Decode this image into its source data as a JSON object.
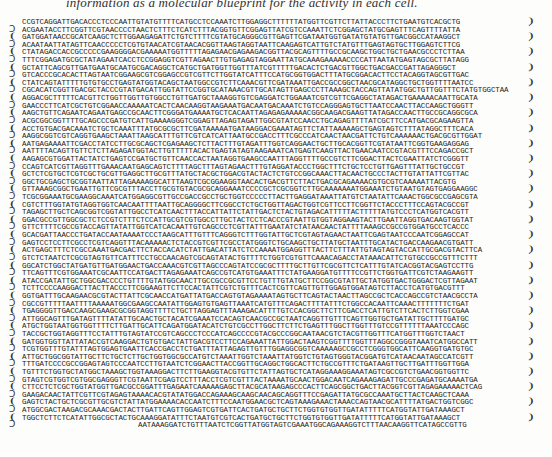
{
  "caption": "information as a molecular blueprint for the activity in each cell.",
  "sequence": {
    "lines": [
      "CCGTCAGGATTGACACCCTCCCAATTGTATGTTTTCATGCCTCCAAATCTTGGAGGCTTTTTTATGGTTCGTTCTTATTACCCTTCTGAATGTCACGCTG",
      "ACGAATACCTTCGGTTCGTAACCCCTAACTCTTTCTCATCTTTACGGTGTTCGGAGTTATCGTCCAAATTCTCGGAGCTATGCGAGTTTCAGTTTTATTA",
      "GATGGATAACCGCATCAAGCTCTTGGAAGAGATTCTGTCTTTTCGTATGCAGGGCGTTGAGTTCGATAATGGTGATATGTATGTTGACGGCCATAAGGCT",
      "ACAATAATTATAGTTCAACCCCCTCGTGTAACATCGTAACACGGTTAAGTAGGTAATTCAAGAGTCATTGTCTATGTTTGAGTAGTGCTTGGAGTCTTCG",
      "CTATAGACCACCGCCCCCGAAGGGGACGAAAAATGGTTTTTAGAGAACGAGAAGACGGTTACGCAGTTTTGCCGCAAGCTGGCTGCTGAACGCCCTCTTAA",
      "TTTCGGAGATGCGCTATAGAATCACCTCCGGAGGTCGTTAGAACTTGTGAGAGTAGGAATTATGCAAAGAAAAACCCCATTAATATGAGTAGCGCTTATAGG",
      "GCTATTCAGCGTTGATGAATGCAATGCGACAGGCTCATGCTGATGGTTGGTTTATCGTTTTTGACACTCTGACGTTGGCTGACGACCGATTAGAGGGCT",
      "GTCACCCGCACACTTAGTAATCGGAAGCGTCGGAGCCGTCGTTCTTGGTATCATTTCCATGCGGTGGACTTTATGCGGACACTTCCTACAGGTAGCGTTGAC",
      "CTATCAGTATTTTTGTGTGCCTGAGTATGGTACAGCTAATGGCCGTCTTCAAACGTTCGATAAATTGACCGCCGGCTAACGCATAGGCTGCTGGTTTTAATCC",
      "CGCACATCGGTTGACGCTACCCGTATGACATTGGTATTCCGGTGCATAAACGTTGCATAGTTGAGCCCTTAAAGCTACCAGTTATATGGCTGTTGGTTTCTATGTGGCTAA",
      "AGGACGCTTTTTCACGTTCTGGTTGGTTGTGGCCTGTTGATGCTAAAGGTGTCGAGGATCTGGAAATCGTCGTTCGAGGCTATAGACTGAAAAACAATTGCATA",
      "GAACCCTTCATCGCTGTCGGAACCAAAAATCACTCAACAAGGTAAGAAATGACAATGACAAATCTGTCCAGGGAGTGCTTAATCCAACTTACCAAGCTGGGTT",
      "AAGCTGTTCAGAATCAGAATGAGCCGCAACTTCGGGATGAAAATGCTCACAATTAGAGAGAAAAACGGCAAGACGAAGTTATAGACCAACTTGCCGCAGGCGCA",
      "ACGCGGCGGTTTTGCAGCCCGATGTCATTGAAAAGGGTCGGAGTTAGAGTAGATTGGCGTATCCAACCTGCAGAGTTTTATCGCTTCCATGACGCAGAAGTTA",
      "ACCTGTGACGACAAATCTGCTCAAATTTATGCGCGCTTCGATAAAAATGATAAGGACGAAATAGTTCTATTAAAAAGCTGAGTAGTCTTTATAGGCTTTCACA",
      "AAGGCGGTCGTCAGGTGAAGCTAAATTAAGCATTTGTTCGTCATCATTAATGCCGACCTTTCGCCCATCAACTAACGATTCTGTCAAAAAACTGACGCGTTGGAT",
      "AATGAGAAAATTCGACCTATCCTTGCGCAGCTCGAGAAGCTCTTACTTTGTAGATTTGGTCAGGAACTGCTTGCACGGTTCGTATAATTCGGTGAAGAGGAG",
      "AATTTTACAGTTGTTCTCTTAGAGATGGTACTTGTTTTTACACTGAGTATAGTAAGAAATCATGAGTCAAGTTACTGAACAATCCGTACGTTTCCAGACCGCT",
      "AAGAGCGTGGATTACTATCTGAGTCCGATGCTGTTCAACCACTAATAGGTGAAGCCAATTTAGGTTTTGCCGTCTTCGGACTTACTCGAATTATCTCGGGTT",
      "CCAGTCATCGTTAGGTTTGAAACAATGAGCAGTCTTTTAGCTTTAGTAGAACTTTGTAGGATACCCTGGCTTTCTGCTCCTGTTGAGTTTATTGCTGCCGT",
      "GCTCTCGTGCTCGTCGCTGCGTTGAGGCTTGCGTTTATGCTACGCTGGACGTACTACTCTGTCCGGCAAACTTACAACTGCCCTACTTGTATTATTCGTTAC",
      "GGCTGCGAGCTGCGGTAATTATTAGAAAAGGCATTTAAGTCGCGGAAGGTAACACTGACGTTCTTACTGACGCAGAAAACGTGCGTCAAAAATTACGTG",
      "GTTAAAGCGGCTGAATTGTTCGCGTTTACCTTGCGTGTACGCGCAGGAAATCCCCGCTCGCGGTCTTGCAAAAAAATGGAAATCTGTAATGTAGTGAGGAAGGC",
      "TCGCGGAAATGCGAAGGCAAATCATGGAGGCGTTGCCGACCGCCTGCTGGTCCCCCTTACTTGAGGATAAATTATGTCTAATATTCAAACTGGCGCCGAGCGTA",
      "CGTCTTTGGTATGTAGGTGGTCAACAATTTTAATTGCAGGGGCTTCGGCCTCTGCTGGTTAGACTGGTCGTTCCTTCGGTTCTACCCTTTCCAGTACGCCGT",
      "TAGAGCTTGCTCAGCGGTCGGTATTGGCCTCATCAACTTTACCATTATTCTATTGACTCTACTGTAGACATTTTTACTTTTTATGTCCCTCATGGTCACGTT",
      "GGACGCCGTTGGCGCTCTCCGTCTTTCTCCATTGCGTCGTGGCCTTGCTACTCCTCACCCGTAATTGTGGTAGGAAGTACTTGAATTAGGTGACAAGTGGTAT",
      "GTTCTTTTCGCCGTACCAGTTATATTGGTCATCACAATTGTCAGCCCTCGTTATTTGAATATCTATAACAACTATTTTAAAGCCGCCGTGGATGCCTCACCC",
      "GCACGATTAACCCTGATACCAATAAAATCCCTAAGCATTTGTTTCAGGGTCTTTGGTATTGCTCGTAGTAGAACTAATTCGAGTAATCCCAATCGGAGCCAT",
      "GAGTCCTCCTTCGCCTCGTCAGGTTTACAAAAACTCTACCGTCGTTCGCCTATGGGTCTGCAAGCTGCTTATGCTAATTTGCATACTGACCAAGAACGTGATT",
      "ACTGAGCTTTCTCGCCAAATGACGACTTCTACCACATCTATTGACATTATCTCCAAAATGGAGGTTTACTTCTTTATTGTAGTAGTACCATTGCGACGTACTTCA",
      "GTCTCTAATCTCGCGTAGTGTTCATTTCCTGCCAACAGTCGCAGTATACTGTTTTCTGGTCGTGTTCAAACAGACCTATAAACATTCTGTGCCGCCGTTTCTTT",
      "GGCATCTGGCTATGATGTTGATGGAACTGACCAAACGTCGTTAGCCCAGTATCCGCGCTTTTGCTTGTTCGCGTTCTCATTTGTATCACGGTACGAGTCCTTG",
      "TTCAGTTTCGTGGAAATCGCAATTCCATGACTTAGAGAAATCAGCCGTCATGTGAAATTTCTATGAAGGATGTTTTCCGTTCTGGTGATTCGTCTAAGAAGTT",
      "ATACCGATATTGCTGGCGACCCCTGTTTTGTATGGCAACTTGCCGCCGCGTTCCTGTTTGTATGCTTCCGGCGTATTGCTATGGTGACTGGGACTCGTTAGAAT",
      "TCTTCCCCAAGGACTTACTTACCCTTCGGAAGTTCTTCCACTATTCGTCTGTTTCACTCGTTCAGTTGTTGGAGTGGATAGTCTTACCTCATGTGACGTTT",
      "GGTGATTTGCAAGAACGCGTACTTATTCGCAACCATGATTATGACCAGTGTAGAAAATAGTGCTTCAGTACTAACTTAGCCGCTCACCAGCCGTCTAACGCCTA",
      "CGCCGTTTTTAATTTTAAAAATGGCGAAGCCAATATTGGAGTGTGAGTTAAATCATGTTTCAGACTTTTATTTCTGGCCACAATTCAAACTTTTTTTCTGAT",
      "TGAGGGGTTGACCAAGCGAAGCGCGGTAGGTTTTCTGCTTAGGAGTTTAAAGACATTTTGTCCACGGCTTCTTCGACCTCATTGTCTTCACTCTTGGTCGAA",
      "ATTGGCAGTTTGATAGTTTTATATTGCAACTGCTACATCGAAATCCACAGTCAACGCCGCTAATCAGGTTGTTTCAGTTGGTGCTGATATTGCTTTTGATGC",
      "ATGCTGGTAATGGTGGTTTTCTTGATTGCATTCAGATGGATACATCTGTCGCCTTGGCTTCTTCTGAGTTTGGCTTGGTTTGTCCGTTTTTTAAATCCCAGC",
      "TACCGCTGGTAGGTTTCCTATTTGTAGTATCCGTCAGCCCTCCCATCAGCCCCGTACGCCCGGCAATAACGTCTACGTTGGTTTCATGGTTTGGTCTAACT",
      "GATGGTGGTTATTATACCGTCAAGGACTGTGTGACTATTGACGTCCTTCCAGAAATTATTGGACTAAGTCGGTTTTGGTTTAGGCCGGGTAAATCATGGCCATT",
      "TCGTGGTTTGTATTTAGTGGAGTGAATTCACCGACCTCTGATTTATTAGAGTTGTTTGGAGGCGGTCAAAAAGCCGCCTCGGGTGGCATTCAAGGTGATGTGC",
      "ATTGCTGGCGGTATTGCTTCTGCTCTTGCTGGTGGCGCCATGTCTAAATTGGTCTAAATTATGGTCTGTAGTGGGTACGGATGTCATAACAATAGCCATCGTT",
      "TTTGATCCCCGCCGGAGTAGTCCCAATCCTTGTAATCTCGGAACTTACCGGTTGCAGGCTGGCACTTCTGCCGTTTCTGATAAGTTGCTTGATTTGGTTGGA",
      "TGTTTCTGGTGCTATGGCTAAAGCTGGTAAAGGACTTCTTGAAGGTACGTGTTCTATTAGTGCTCATAGGAAAGGAAATAGTCGCCGTCTGAACGGTGGTTC",
      "GTAGTCGTGGTCGTGGCGAGGGTTCGTAATTCGAGTCCTTTACCTCGTCGTTTACTAAAATGCAACTGGACAATCAGAAAGAGATTGCCCGAGATGCAAAATGA",
      "CTTCCTCTCGCTGGTATGGTTGACGCCGGATTTGAGAATCAAAAAGAGCTTACGCATAAGAGCCCACTTCAGCGGCTGACTTACGGTCGTTAGAGAAAAACTCAG",
      "GAAGACAACTATTCGTTCGTAGAGTAAAACACGTATATGGACCAGAAAGCAAGCAACAGCAGGTTTCCGAGATTATGCGCCAAATGCTTACTCAAGCTCAAA",
      "GAGTCTACTGCTCGCGTTGCGTCTATTATGGAAAACACCAATCTTTCCAATGGAACGCTCAGTAAAGAAACTAAACCAGTAACGCATTTTATGACTGGTCGGC",
      "ATGGCGACTAAGACGCAAACGACTACTTGATTCAGTTGGAGTCGTGATTCACTGATGCTGCTTCTGGTGTGGTTGATATTTTTCATGGTATTGATAAAGCT",
      "TGGCTCTTCTCATATTGGCGCTACTGCAAAGGATATTTCTAATGTCGTCACTGATGCTGCTTCTGGTGTGGTTGATATTTTTCATGGTATTGATAAAGCT",
      "AATAAAGGATCTGTTTAATCTCGGTTATGGTAGTCGAAATGGCAGAAAGGTCTTTAACAAGGTTCATAGCCGTTG"
    ],
    "left_brackets": [
      "",
      "Ɔ",
      "❨",
      "Ɔ",
      "❨",
      "Ɔ",
      "❨",
      "Ɔ",
      "❨",
      "Ɔ",
      "❨",
      "Ɔ",
      "❨",
      "Ɔ",
      "❨",
      "Ɔ",
      "❨",
      "Ɔ",
      "❨",
      "Ɔ",
      "❨",
      "Ɔ",
      "❨",
      "Ɔ",
      "❨",
      "Ɔ",
      "❨",
      "Ɔ",
      "❨",
      "Ɔ",
      "❨",
      "Ɔ",
      "❨",
      "Ɔ",
      "❨",
      "Ɔ",
      "❨",
      "Ɔ",
      "❨",
      "Ɔ",
      "❨",
      "Ɔ",
      "❨",
      "Ɔ",
      "❨",
      "Ɔ",
      "❨",
      "Ɔ",
      "❨",
      "Ɔ",
      "❨",
      "Ɔ",
      "❨",
      "Ɔ",
      ""
    ],
    "right_brackets": [
      "❩",
      "´",
      "❩",
      "´",
      "❩",
      "´",
      "❩",
      "´",
      "❩",
      "´",
      "❩",
      "´",
      "❩",
      "´",
      "❩",
      "´",
      "❩",
      "´",
      "❩",
      "´",
      "❩",
      "´",
      "❩",
      "´",
      "❩",
      "´",
      "❩",
      "´",
      "❩",
      "´",
      "❩",
      "´",
      "❩",
      "´",
      "❩",
      "´",
      "❩",
      "´",
      "❩",
      "´",
      "❩",
      "´",
      "❩",
      "´",
      "❩",
      "´",
      "❩",
      "´",
      "❩",
      "´",
      "❩",
      "´",
      "❩",
      "´",
      "´"
    ]
  }
}
